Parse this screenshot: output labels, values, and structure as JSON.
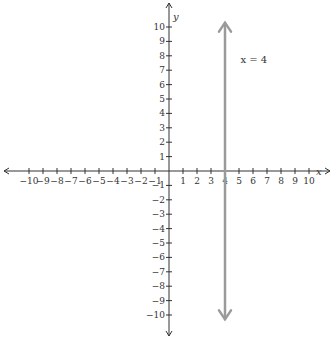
{
  "chart_data": {
    "type": "line",
    "title": "",
    "xlabel": "x",
    "ylabel": "y",
    "xlim": [
      -10,
      10
    ],
    "ylim": [
      -10,
      10
    ],
    "grid": false,
    "x_ticks": [
      -10,
      -9,
      -8,
      -7,
      -6,
      -5,
      -4,
      -3,
      -2,
      -1,
      1,
      2,
      3,
      4,
      5,
      6,
      7,
      8,
      9,
      10
    ],
    "y_ticks": [
      -10,
      -9,
      -8,
      -7,
      -6,
      -5,
      -4,
      -3,
      -2,
      -1,
      1,
      2,
      3,
      4,
      5,
      6,
      7,
      8,
      9,
      10
    ],
    "series": [
      {
        "name": "x = 4",
        "kind": "vertical_line",
        "x": 4,
        "y_range": [
          -10.3,
          10.3
        ],
        "color": "#9a9a9a",
        "arrows": "both"
      }
    ],
    "annotations": [
      {
        "text": "x = 4",
        "x": 5.1,
        "y": 7.5
      }
    ]
  },
  "layout": {
    "origin_px": [
      169,
      171
    ],
    "x_step_px": 14,
    "y_step_px": 14.4,
    "x_axis_extent_px": [
      4,
      330
    ],
    "y_axis_extent_px": [
      3,
      336
    ],
    "axis_color": "#333333"
  },
  "labels": {
    "x_axis_name": "x",
    "y_axis_name": "y",
    "line_annotation": "x = 4"
  }
}
